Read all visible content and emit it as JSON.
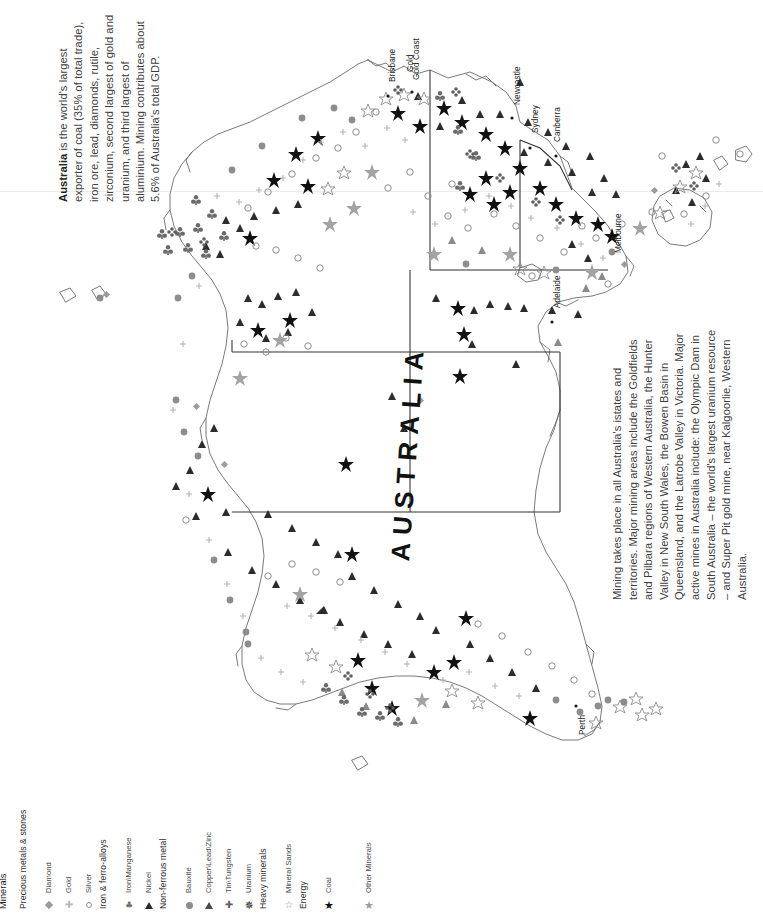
{
  "page": {
    "title": "AUSTRALIA",
    "map_title": "AUSTRALIA"
  },
  "intro": {
    "lead": "Australia",
    "text": " is the world's largest exporter of coal (35% of total trade), iron ore, lead, diamonds, rutile, zirconium, second largest of gold and uranium, and third largest of aluminium. Mining contributes about 5.6% of Australia's total GDP."
  },
  "body": {
    "text": "Mining takes place in all Australia's istates and territories. Major mining areas include the Goldfields and Pilbara regions of Western Australia, the Hunter Valley in New South Wales, the Bowen Basin in Queensland, and the Latrobe Valley in Victoria. Major active mines in Australia include: the Olympic Dam in South Australia – the world's largest uranium resource – and Super Pit gold mine, near Kalgoorlie, Western Australia."
  },
  "cities": [
    {
      "name": "Brisbane",
      "x": 388,
      "y": 82
    },
    {
      "name": "Gold Coast",
      "x": 412,
      "y": 80
    },
    {
      "name": "Gold",
      "x": 406,
      "y": 72
    },
    {
      "name": "Newcastle",
      "x": 513,
      "y": 105
    },
    {
      "name": "Sydney",
      "x": 531,
      "y": 133
    },
    {
      "name": "Canberra",
      "x": 553,
      "y": 142
    },
    {
      "name": "Melbourne",
      "x": 614,
      "y": 253
    },
    {
      "name": "Adelaide",
      "x": 553,
      "y": 308
    },
    {
      "name": "Perth",
      "x": 578,
      "y": 735
    }
  ],
  "legend": {
    "title": "Minerals",
    "groups": [
      {
        "heading": "Precious metals & stones",
        "items": [
          {
            "label": "Diamond",
            "symbol": "diamond-icon"
          },
          {
            "label": "Gold",
            "symbol": "cross-icon"
          },
          {
            "label": "Silver",
            "symbol": "open-circle-icon"
          }
        ]
      },
      {
        "heading": "Iron & ferro-alloys",
        "items": [
          {
            "label": "Iron\\Manganese",
            "symbol": "club-icon"
          },
          {
            "label": "Nickel",
            "symbol": "triangle-icon"
          }
        ]
      },
      {
        "heading": "Non-ferrous metal",
        "items": [
          {
            "label": "Bauxite",
            "symbol": "filled-circle-icon"
          },
          {
            "label": "Copper\\Lead\\Zinc",
            "symbol": "triangle-grey-icon"
          },
          {
            "label": "Tin\\Tungsten",
            "symbol": "plus-club-icon"
          },
          {
            "label": "Uranium",
            "symbol": "star8-icon"
          }
        ]
      },
      {
        "heading": "Heavy minerals",
        "items": [
          {
            "label": "Mineral Sands",
            "symbol": "open-star-icon"
          }
        ]
      },
      {
        "heading": "Energy",
        "items": [
          {
            "label": "Coal",
            "symbol": "star5-icon"
          }
        ]
      },
      {
        "heading": "",
        "items": [
          {
            "label": "Other Minerals",
            "symbol": "star5-grey-icon"
          }
        ]
      }
    ]
  },
  "colors": {
    "coastline": "#5e5e5e",
    "border": "#333333",
    "text": "#3d3d3d",
    "background": "#ffffff"
  }
}
